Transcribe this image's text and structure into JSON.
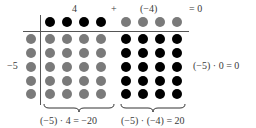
{
  "diagram": {
    "title_equation": {
      "term1": "4",
      "plus": "+",
      "term2": "(−4)",
      "result": "= 0"
    },
    "row_label": "−5",
    "right_equation": "(−5) · 0 = 0",
    "bottom_equations": {
      "left": "(−5) · 4 = −20",
      "right": "(−5) · (−4) = 20"
    },
    "colors": {
      "positive_counter": "#000000",
      "negative_counter": "#7a7a7a",
      "axis_line": "#555555"
    },
    "top_row": {
      "positive_count": 4,
      "negative_count": 4
    },
    "left_column": {
      "negative_count": 5
    },
    "grid": {
      "left_block": {
        "rows": 5,
        "cols": 4,
        "counter": "negative",
        "product": -20
      },
      "right_block": {
        "rows": 5,
        "cols": 4,
        "counter": "positive",
        "product": 20
      }
    }
  }
}
